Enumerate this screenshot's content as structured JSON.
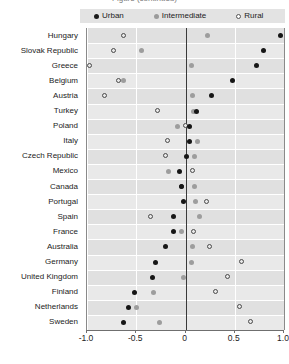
{
  "title": {
    "clipped_text": "Figure (continued)"
  },
  "legend": {
    "position": "top",
    "items": [
      {
        "label": "Urban",
        "marker": "filled-dark-circle",
        "color": "#161616",
        "name": "legend-item-urban"
      },
      {
        "label": "Intermediate",
        "marker": "filled-grey-circle",
        "color": "#9d9d9d",
        "name": "legend-item-intermediate"
      },
      {
        "label": "Rural",
        "marker": "open-circle",
        "color": "#ffffff",
        "name": "legend-item-rural"
      }
    ]
  },
  "axis": {
    "x_ticks": [
      "-1.0",
      "-0.5",
      "0",
      "0.5",
      "1.0"
    ],
    "x_tick_values": [
      -1.0,
      -0.5,
      0,
      0.5,
      1.0
    ],
    "xlim": [
      -1.0,
      1.0
    ],
    "ylabel": "",
    "xlabel": ""
  },
  "chart_data": {
    "type": "scatter",
    "title": "",
    "xlabel": "",
    "ylabel": "",
    "xlim": [
      -1.0,
      1.0
    ],
    "grid": true,
    "legend_position": "top",
    "categories": [
      "Hungary",
      "Slovak Republic",
      "Greece",
      "Belgium",
      "Austria",
      "Turkey",
      "Poland",
      "Italy",
      "Czech Republic",
      "Mexico",
      "Canada",
      "Portugal",
      "Spain",
      "France",
      "Australia",
      "Germany",
      "United Kingdom",
      "Finland",
      "Netherlands",
      "Sweden"
    ],
    "series": [
      {
        "name": "Urban",
        "color": "#161616",
        "marker": "filled-dark-circle",
        "values": [
          0.96,
          0.79,
          0.72,
          0.48,
          0.26,
          0.11,
          0.04,
          0.04,
          0.01,
          -0.06,
          -0.04,
          -0.02,
          -0.12,
          -0.12,
          -0.2,
          -0.3,
          -0.33,
          -0.52,
          -0.58,
          -0.63
        ]
      },
      {
        "name": "Intermediate",
        "color": "#9d9d9d",
        "marker": "filled-grey-circle",
        "values": [
          0.22,
          -0.45,
          0.06,
          -0.63,
          0.07,
          0.08,
          -0.08,
          0.12,
          0.09,
          -0.17,
          0.09,
          0.1,
          0.14,
          -0.04,
          0.07,
          0.06,
          -0.02,
          -0.32,
          -0.5,
          -0.26
        ]
      },
      {
        "name": "Rural",
        "color": "#ffffff",
        "marker": "open-circle",
        "values": [
          -0.62,
          -0.73,
          -0.97,
          -0.68,
          -0.82,
          -0.28,
          0.0,
          -0.18,
          -0.2,
          0.08,
          -0.04,
          0.22,
          -0.35,
          0.09,
          0.25,
          0.57,
          0.43,
          0.31,
          0.55,
          0.67
        ]
      }
    ]
  }
}
